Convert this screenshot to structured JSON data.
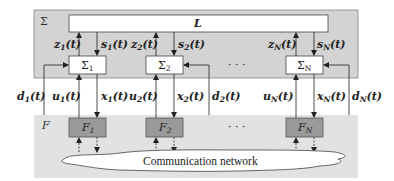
{
  "diagram": {
    "upper_panel": {
      "label": "Σ",
      "color": "#d3d3d3"
    },
    "lower_panel": {
      "label": "F",
      "color": "#e0e0e0"
    },
    "coupling_block": {
      "label": "L"
    },
    "subsystems": [
      {
        "label": "Σ",
        "sub": "1",
        "z": "z",
        "z_sub": "1",
        "s": "s",
        "s_sub": "1",
        "u": "u",
        "u_sub": "1",
        "x": "x",
        "x_sub": "1",
        "d": "d",
        "d_sub": "1",
        "controller": "F",
        "controller_sub": "1"
      },
      {
        "label": "Σ",
        "sub": "2",
        "z": "z",
        "z_sub": "2",
        "s": "s",
        "s_sub": "2",
        "u": "u",
        "u_sub": "2",
        "x": "x",
        "x_sub": "2",
        "d": "d",
        "d_sub": "2",
        "controller": "F",
        "controller_sub": "2"
      },
      {
        "label": "Σ",
        "sub": "N",
        "z": "z",
        "z_sub": "N",
        "s": "s",
        "s_sub": "N",
        "u": "u",
        "u_sub": "N",
        "x": "x",
        "x_sub": "N",
        "d": "d",
        "d_sub": "N",
        "controller": "F",
        "controller_sub": "N"
      }
    ],
    "time_arg": "(t)",
    "ellipsis": "· · ·",
    "network": {
      "label": "Communication network"
    },
    "controller_color": "#9a9a9a"
  }
}
